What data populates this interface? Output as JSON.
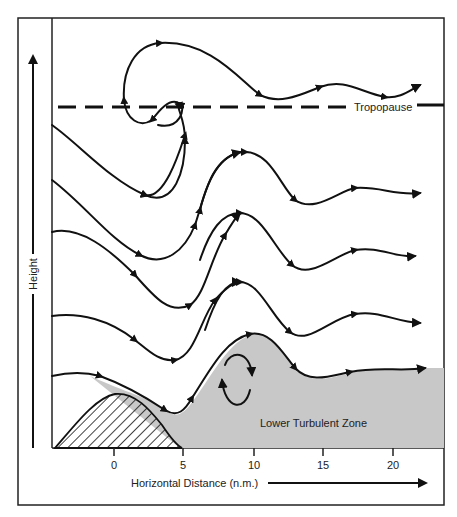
{
  "diagram": {
    "labels": {
      "tropopause": "Tropopause",
      "lower_zone": "Lower Turbulent Zone",
      "y_axis": "Height",
      "x_axis": "Horizontal Distance (n.m.)"
    },
    "x_ticks": [
      "0",
      "5",
      "10",
      "15",
      "20"
    ],
    "colors": {
      "line": "#111111",
      "turbulent_zone": "#c8c8c8",
      "frame": "#222222"
    }
  }
}
